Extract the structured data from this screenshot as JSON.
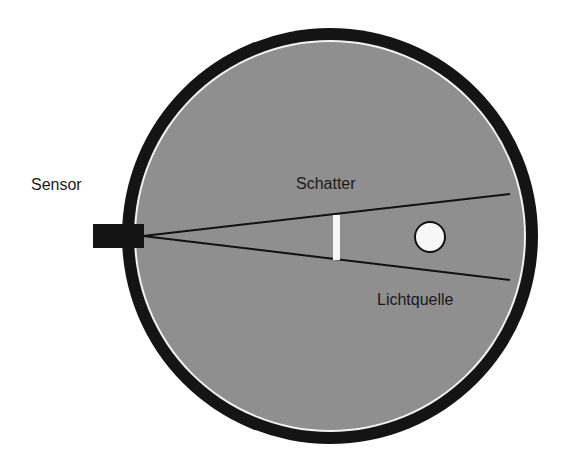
{
  "labels": {
    "sensor": "Sensor",
    "shadow": "Schatter",
    "light_source": "Lichtquelle"
  },
  "colors": {
    "background": "#ffffff",
    "ring": "#141414",
    "fill": "#8f8f8f",
    "rim_highlight": "#f2f2f2",
    "lines": "#111111",
    "light": "#f7f7f7"
  }
}
